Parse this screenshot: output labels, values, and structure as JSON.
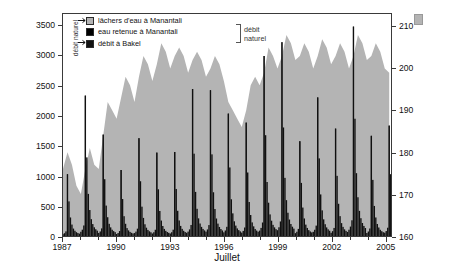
{
  "chart_data": {
    "type": "area",
    "title": "",
    "xlabel": "Juillet",
    "x_start_year": 1987,
    "x_end_year": 2005,
    "x_tick_years": [
      1987,
      1990,
      1993,
      1996,
      1999,
      2002,
      2005
    ],
    "x_tick_labels": [
      "1987",
      "1990",
      "1993",
      "1996",
      "1999",
      "2002",
      "2005"
    ],
    "grid": false,
    "legend_position": "top-left",
    "axes": [
      {
        "side": "left",
        "label": "débit mensuel du fleuve à Bakel (m3/s)",
        "label_plain": "débit mensuel du fleuve à Bakel (m",
        "label_sup": "3",
        "label_tail": "/s)",
        "ylim": [
          0,
          3700
        ],
        "ticks": [
          0,
          500,
          1000,
          1500,
          2000,
          2500,
          3000,
          3500
        ],
        "tick_labels": [
          "0",
          "500",
          "1000",
          "1500",
          "2000",
          "2500",
          "3000",
          "3500"
        ]
      },
      {
        "side": "right",
        "label": "niveau d'eau dans le Lac de Manantali (m IGN)",
        "ylim": [
          160,
          213
        ],
        "ticks": [
          160,
          170,
          180,
          190,
          200,
          210
        ],
        "tick_labels": [
          "160",
          "170",
          "180",
          "190",
          "200",
          "210"
        ]
      }
    ],
    "series": [
      {
        "name": "lâchers d'eau à Manantali",
        "kind": "area",
        "color": "#b4b4b4",
        "axis": "right",
        "unit": "m IGN",
        "description": "niveau d'eau dans le Lac de Manantali (aire grise)",
        "x": [
          1987.0,
          1987.25,
          1987.5,
          1987.75,
          1988.0,
          1988.25,
          1988.5,
          1988.75,
          1989.0,
          1989.25,
          1989.5,
          1989.75,
          1990.0,
          1990.25,
          1990.5,
          1990.75,
          1991.0,
          1991.25,
          1991.5,
          1991.75,
          1992.0,
          1992.25,
          1992.5,
          1992.75,
          1993.0,
          1993.25,
          1993.5,
          1993.75,
          1994.0,
          1994.25,
          1994.5,
          1994.75,
          1995.0,
          1995.25,
          1995.5,
          1995.75,
          1996.0,
          1996.25,
          1996.5,
          1996.75,
          1997.0,
          1997.25,
          1997.5,
          1997.75,
          1998.0,
          1998.25,
          1998.5,
          1998.75,
          1999.0,
          1999.25,
          1999.5,
          1999.75,
          2000.0,
          2000.25,
          2000.5,
          2000.75,
          2001.0,
          2001.25,
          2001.5,
          2001.75,
          2002.0,
          2002.25,
          2002.5,
          2002.75,
          2003.0,
          2003.25,
          2003.5,
          2003.75,
          2004.0,
          2004.25,
          2004.5,
          2004.75,
          2005.0,
          2005.25
        ],
        "values": [
          176,
          180,
          177,
          172,
          170,
          176,
          181,
          177,
          176,
          184,
          192,
          190,
          188,
          193,
          198,
          196,
          192,
          198,
          203,
          201,
          197,
          201,
          206,
          204,
          200,
          203,
          205,
          203,
          199,
          202,
          204,
          202,
          198,
          200,
          203,
          201,
          197,
          192,
          190,
          188,
          186,
          190,
          196,
          198,
          196,
          199,
          205,
          203,
          200,
          203,
          208,
          206,
          202,
          203,
          206,
          204,
          200,
          203,
          207,
          205,
          201,
          203,
          206,
          204,
          200,
          203,
          208,
          206,
          202,
          203,
          206,
          204,
          200,
          199
        ]
      },
      {
        "name": "eau retenue à Manantali",
        "kind": "spike",
        "color": "#000000",
        "axis": "left",
        "unit": "m3/s",
        "description": "pointes annuelles de crue retenues"
      },
      {
        "name": "débit à Bakel",
        "kind": "spike",
        "color": "#111111",
        "axis": "left",
        "unit": "m3/s",
        "description": "débit mensuel du fleuve à Bakel, pics annuels",
        "annual_peak_years": [
          1987,
          1988,
          1989,
          1990,
          1991,
          1992,
          1993,
          1994,
          1995,
          1996,
          1997,
          1998,
          1999,
          2000,
          2001,
          2002,
          2003,
          2004,
          2005
        ],
        "annual_peak_values": [
          1030,
          2340,
          1690,
          1100,
          1630,
          1390,
          1400,
          2450,
          2430,
          2040,
          1890,
          3000,
          3230,
          1580,
          2310,
          1790,
          3490,
          1670,
          1840
        ]
      }
    ],
    "legend": [
      {
        "label": "lâchers d'eau à Manantali",
        "color": "#b4b4b4"
      },
      {
        "label": "eau retenue à Manantali",
        "color": "#000000"
      },
      {
        "label": "débit à Bakel",
        "color": "#111111"
      }
    ],
    "annotations": [
      {
        "name": "bracket-label",
        "text_line1": "débit",
        "text_line2": "naturel"
      },
      {
        "name": "vertical-label",
        "text": "débit naturel"
      }
    ]
  },
  "colors": {
    "area_gray": "#b4b4b4",
    "spike_black": "#000000",
    "frame": "#3a3a3a",
    "background": "#ffffff",
    "text": "#111111"
  }
}
